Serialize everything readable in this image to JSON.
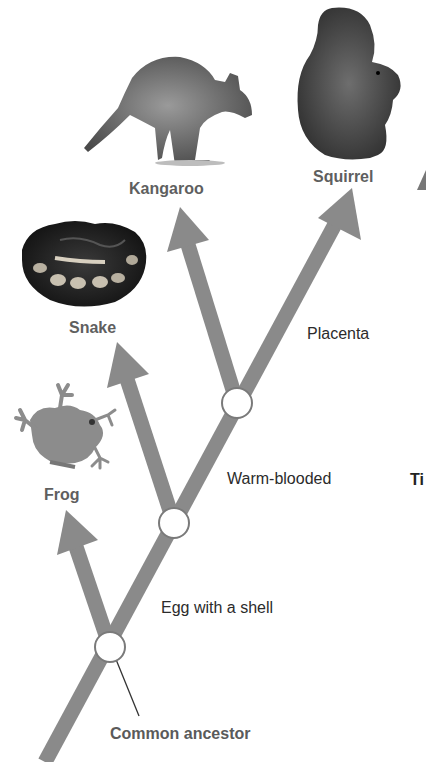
{
  "diagram": {
    "type": "cladogram",
    "colors": {
      "branch": "#8a8a8a",
      "node_fill": "#ffffff",
      "node_stroke": "#7a7a7a",
      "taxon_label": "#5f5f5f",
      "trait_label": "#2b2b2b"
    },
    "taxa": [
      {
        "id": "frog",
        "label": "Frog",
        "image": "frog-image"
      },
      {
        "id": "snake",
        "label": "Snake",
        "image": "snake-image"
      },
      {
        "id": "kangaroo",
        "label": "Kangaroo",
        "image": "kangaroo-image"
      },
      {
        "id": "squirrel",
        "label": "Squirrel",
        "image": "squirrel-image"
      }
    ],
    "traits": [
      {
        "label": "Egg with a shell"
      },
      {
        "label": "Warm-blooded"
      },
      {
        "label": "Placenta"
      }
    ],
    "root_label": "Common ancestor",
    "cut_off_text": "Ti"
  }
}
